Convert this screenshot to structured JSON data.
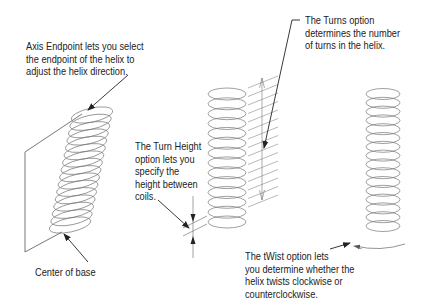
{
  "figure": {
    "type": "technical-illustration",
    "colors": {
      "line": "#555555",
      "coil": "#777777",
      "text": "#222222",
      "background": "#ffffff"
    }
  },
  "callouts": {
    "axis_endpoint": "Axis Endpoint lets you select\nthe endpoint of the helix to\nadjust the helix direction.",
    "center_of_base": "Center of base",
    "turn_height": "The Turn Height\noption lets you\nspecify the\nheight between\ncoils.",
    "turns": "The Turns option\ndetermines the number\nof turns in the helix.",
    "twist": "The tWist option lets\nyou determine whether the\nhelix twists clockwise or\ncounterclockwise."
  },
  "helices": [
    {
      "name": "tilted-helix",
      "turns": 16,
      "note": "axis endpoint example"
    },
    {
      "name": "turns-helix",
      "turns": 14,
      "note": "turn height / turns example"
    },
    {
      "name": "twist-helix",
      "turns": 16,
      "note": "twist example"
    }
  ]
}
